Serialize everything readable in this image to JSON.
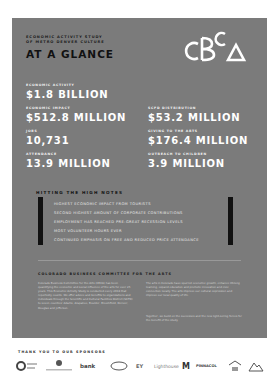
{
  "header": {
    "eyebrow_line1": "Economic Activity Study",
    "eyebrow_line2": "of Metro Denver Culture",
    "title": "AT A GLANCE",
    "logo_text": "CBCA"
  },
  "stats": [
    {
      "label": "Economic Activity",
      "value": "$1.8 BILLION"
    },
    {
      "label": "Economic Impact",
      "value": "$512.8 MILLION"
    },
    {
      "label": "SCFD Distribution",
      "value": "$53.2 MILLION"
    },
    {
      "label": "Jobs",
      "value": "10,731"
    },
    {
      "label": "Giving to the Arts",
      "value": "$176.4 MILLION"
    },
    {
      "label": "Attendance",
      "value": "13.9 MILLION"
    },
    {
      "label": "Outreach to Children",
      "value": "3.9 MILLION"
    }
  ],
  "high_notes": {
    "title": "Hitting the High Notes",
    "items": [
      "Highest economic impact from tourists",
      "Second highest amount of corporate contributions",
      "Employment has reached pre-great recession levels",
      "Most volunteer hours ever",
      "Continued emphasis on free and reduced price attendance"
    ]
  },
  "about": {
    "title": "Colorado Business Committee for the Arts",
    "left_paragraph": "Colorado Business Committee for the Arts (CBCA) has been quantifying the economic and social influence of the arts for over 25 years. This Economic Activity Study is conducted every 2018 that reportedly counts. We offer advice and benefits to organizations and individuals through the Scientific and Cultural Facilities District (SCFD) to seven counties: Adams, Arapahoe, Boulder, Broomfield, Denver, Douglas and Jefferson.",
    "right_paragraph_1": "The arts in Colorado have spurred economic growth, enhance lifelong learning, expand education and promote innovation and civic connection locally. The arts improve our cultural expression and improve our local quality of life.",
    "right_paragraph_2": "Together, we build on the successes and the new light-sering forces for the benefit of the study."
  },
  "sponsors": {
    "title": "Thank you to our sponsors",
    "logos": [
      "circle-logo",
      "Community Foundation",
      "bank",
      "oval-logo",
      "EY",
      "Lighthouse",
      "M",
      "PINNACOL",
      "house-logo",
      "mountain-logo"
    ]
  },
  "colors": {
    "panel": "#7b7b7b",
    "heading_dark": "#111111",
    "value_white": "#ffffff",
    "bar_black": "#111111"
  }
}
